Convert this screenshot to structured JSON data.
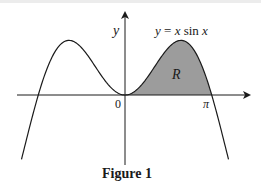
{
  "figure": {
    "caption": "Figure 1",
    "curve_label": "y = x sin x",
    "curve_label_parts": {
      "y": "y",
      "eq": " = ",
      "x1": "x",
      "sin": " sin ",
      "x2": "x"
    },
    "axis_y_label": "y",
    "origin_label": "0",
    "pi_label": "π",
    "region_label": "R",
    "colors": {
      "stroke": "#1a1a1a",
      "region_fill": "#9c9c9c",
      "background": "#ffffff"
    }
  },
  "chart_data": {
    "type": "line",
    "title": "Figure 1",
    "function": "y = x sin x",
    "xlabel": "",
    "ylabel": "y",
    "x_tick_labels": [
      "0",
      "π"
    ],
    "x_range": [
      -3.75,
      3.75
    ],
    "series": [
      {
        "name": "y = x sin x",
        "x": [
          -3.75,
          -3.14,
          -2.5,
          -2.03,
          -1.5,
          -1.0,
          -0.5,
          0,
          0.5,
          1.0,
          1.5,
          2.03,
          2.5,
          3.14,
          3.75
        ],
        "values": [
          -2.14,
          0.0,
          1.5,
          1.82,
          1.5,
          0.84,
          0.24,
          0,
          0.24,
          0.84,
          1.5,
          1.82,
          1.5,
          0.0,
          -2.14
        ]
      }
    ],
    "shaded_region": {
      "label": "R",
      "from": 0,
      "to": 3.14159,
      "between": "curve and x-axis"
    },
    "annotations": [
      "y = x sin x",
      "R",
      "0",
      "π"
    ],
    "grid": false,
    "legend": null
  }
}
